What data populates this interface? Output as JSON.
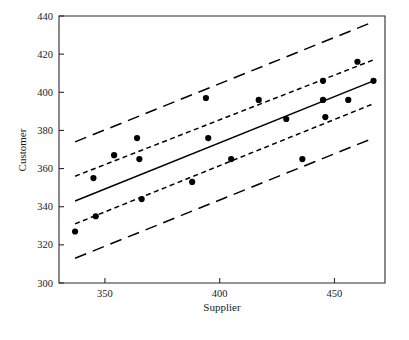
{
  "chart_data": {
    "type": "scatter",
    "title": "",
    "xlabel": "Supplier",
    "ylabel": "Customer",
    "xlim": [
      330,
      472
    ],
    "ylim": [
      300,
      440
    ],
    "xticks": [
      350,
      400,
      450
    ],
    "xtick_labels": [
      "350",
      "400",
      "450"
    ],
    "yticks": [
      300,
      320,
      340,
      360,
      380,
      400,
      420,
      440
    ],
    "ytick_labels": [
      "300",
      "320",
      "340",
      "360",
      "380",
      "400",
      "420",
      "440"
    ],
    "grid": false,
    "legend": "none",
    "point_color": "#000000",
    "line_color": "#000000",
    "points": [
      {
        "x": 337,
        "y": 327
      },
      {
        "x": 345,
        "y": 355
      },
      {
        "x": 346,
        "y": 335
      },
      {
        "x": 354,
        "y": 367
      },
      {
        "x": 364,
        "y": 376
      },
      {
        "x": 365,
        "y": 365
      },
      {
        "x": 366,
        "y": 344
      },
      {
        "x": 388,
        "y": 353
      },
      {
        "x": 394,
        "y": 397
      },
      {
        "x": 395,
        "y": 376
      },
      {
        "x": 405,
        "y": 365
      },
      {
        "x": 417,
        "y": 396
      },
      {
        "x": 429,
        "y": 386
      },
      {
        "x": 436,
        "y": 365
      },
      {
        "x": 445,
        "y": 406
      },
      {
        "x": 445,
        "y": 396
      },
      {
        "x": 446,
        "y": 387
      },
      {
        "x": 456,
        "y": 396
      },
      {
        "x": 460,
        "y": 416
      },
      {
        "x": 467,
        "y": 406
      }
    ],
    "series": [
      {
        "name": "regression-line",
        "style": "solid",
        "x": [
          337,
          467
        ],
        "values": [
          343,
          406
        ]
      },
      {
        "name": "confidence-band-upper",
        "style": "short-dash",
        "x": [
          337,
          467
        ],
        "values": [
          356,
          417
        ]
      },
      {
        "name": "confidence-band-lower",
        "style": "short-dash",
        "x": [
          337,
          467
        ],
        "values": [
          331,
          394
        ]
      },
      {
        "name": "prediction-band-upper",
        "style": "long-dash",
        "x": [
          337,
          467
        ],
        "values": [
          374,
          437
        ]
      },
      {
        "name": "prediction-band-lower",
        "style": "long-dash",
        "x": [
          337,
          467
        ],
        "values": [
          313,
          376
        ]
      }
    ]
  }
}
